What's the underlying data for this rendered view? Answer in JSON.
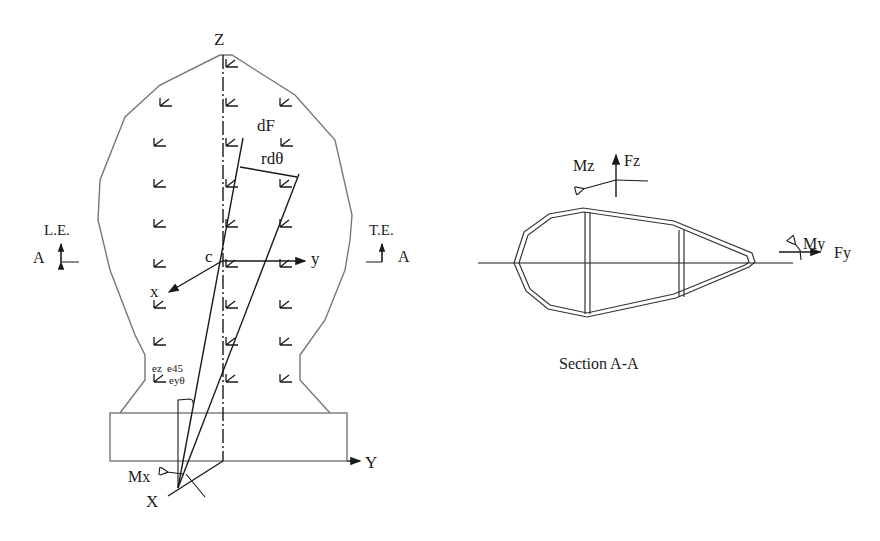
{
  "figure": {
    "left_view": {
      "axis_labels": {
        "Z": "Z",
        "Y": "Y",
        "X": "X",
        "y": "y",
        "x": "x",
        "c": "c"
      },
      "force_labels": {
        "dF": "dF",
        "rdtheta": "rdθ",
        "Mx": "Mx"
      },
      "edge_labels": {
        "leading_edge": "L.E.",
        "trailing_edge": "T.E.",
        "section_left": "A",
        "section_right": "A"
      },
      "strain_gauge_labels": {
        "ez": "ez",
        "e45": "e45",
        "eytheta": "eyθ"
      },
      "gauge_arrow_rows": 9
    },
    "right_view": {
      "caption": "Section A-A",
      "labels": {
        "Mz": "Mz",
        "Fz": "Fz",
        "My": "My",
        "Fy": "Fy"
      }
    },
    "colors": {
      "line": "#1a1a1a",
      "outline": "#777777",
      "background": "#ffffff"
    }
  }
}
